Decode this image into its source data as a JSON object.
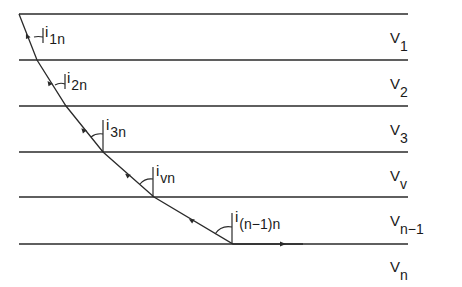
{
  "diagram": {
    "layer_boundaries_y": [
      14,
      60,
      106,
      152,
      197,
      244
    ],
    "line_x_range": [
      19,
      408
    ],
    "ray_points": [
      [
        19,
        14
      ],
      [
        37,
        60
      ],
      [
        66,
        106
      ],
      [
        103,
        152
      ],
      [
        154,
        197
      ],
      [
        233,
        244
      ],
      [
        303,
        244
      ]
    ],
    "colors": {
      "line": "#2a2a2a",
      "text": "#1a1a1a",
      "background": "#ffffff"
    },
    "layer_labels": [
      {
        "main": "V",
        "sub": "1",
        "x": 390,
        "y": 30
      },
      {
        "main": "V",
        "sub": "2",
        "x": 390,
        "y": 76
      },
      {
        "main": "V",
        "sub": "3",
        "x": 390,
        "y": 122
      },
      {
        "main": "V",
        "sub": "v",
        "x": 390,
        "y": 168
      },
      {
        "main": "V",
        "sub": "n−1",
        "x": 390,
        "y": 213
      },
      {
        "main": "V",
        "sub": "n",
        "x": 390,
        "y": 259
      }
    ],
    "angle_labels": [
      {
        "main": "i",
        "sub": "1n",
        "x": 44,
        "y": 24
      },
      {
        "main": "i",
        "sub": "2n",
        "x": 67,
        "y": 70
      },
      {
        "main": "i",
        "sub": "3n",
        "x": 106,
        "y": 116
      },
      {
        "main": "i",
        "sub": "vn",
        "x": 156,
        "y": 162
      },
      {
        "main": "i",
        "sub": "(n−1)n",
        "x": 235,
        "y": 208
      }
    ]
  }
}
